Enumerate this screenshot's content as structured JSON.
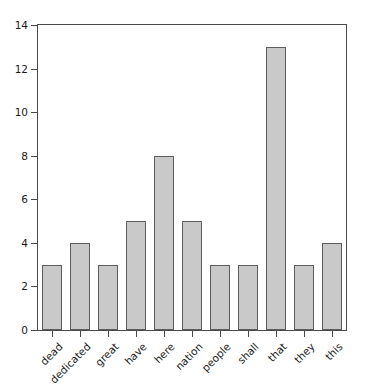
{
  "chart_data": {
    "type": "bar",
    "title": "",
    "subtitle": "",
    "xlabel": "",
    "ylabel": "",
    "categories": [
      "dead",
      "dedicated",
      "great",
      "have",
      "here",
      "nation",
      "people",
      "shall",
      "that",
      "they",
      "this"
    ],
    "values": [
      3,
      4,
      3,
      5,
      8,
      5,
      3,
      3,
      13,
      3,
      4
    ],
    "series": [
      {
        "name": "word frequency",
        "values": [
          3,
          4,
          3,
          5,
          8,
          5,
          3,
          3,
          13,
          3,
          4
        ]
      }
    ],
    "ylim": [
      0,
      14
    ],
    "yticks": [
      0,
      2,
      4,
      6,
      8,
      10,
      12,
      14
    ],
    "ytick_labels": [
      "0",
      "2",
      "4",
      "6",
      "8",
      "10",
      "12",
      "14"
    ],
    "grid": false,
    "legend": false,
    "legend_position": "none",
    "bar_fill_color": "#c9c9c9",
    "bar_edge_color": "#5d5d5d",
    "axis_color": "#4a4a4a",
    "background_color": "#ffffff",
    "xtick_label_rotation": -45
  }
}
